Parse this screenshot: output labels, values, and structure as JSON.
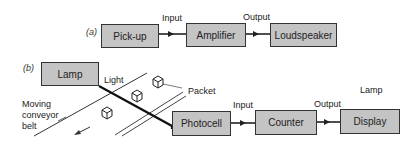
{
  "part_a": {
    "tag": "(a)",
    "blocks": [
      "Pick-up",
      "Amplifier",
      "Loudspeaker"
    ],
    "signals": {
      "input": "Input",
      "output": "Output"
    }
  },
  "part_b": {
    "tag": "(b)",
    "source": "Lamp",
    "beam_label": "Light",
    "item_label": "Packet",
    "belt_label_lines": [
      "Moving",
      "conveyor",
      "belt"
    ],
    "blocks": [
      "Photocell",
      "Counter",
      "Display"
    ],
    "signals": {
      "input": "Input",
      "output": "Output"
    },
    "display_note": "Lamp"
  },
  "colors": {
    "block_fill": "#c4c4c4",
    "stroke": "#333333"
  }
}
